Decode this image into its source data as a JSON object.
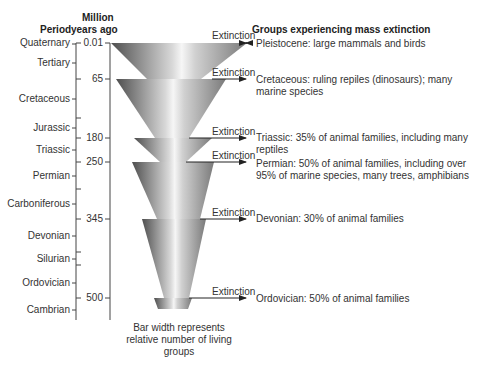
{
  "header": {
    "period_label": "Period",
    "years_label_line1": "Million",
    "years_label_line2": "years ago",
    "groups_label": "Groups experiencing mass extinction"
  },
  "periods": [
    {
      "name": "Quaternary",
      "y": 17
    },
    {
      "name": "Tertiary",
      "y": 35
    },
    {
      "name": "Cretaceous",
      "y": 70
    },
    {
      "name": "Jurassic",
      "y": 127
    },
    {
      "name": "Triassic",
      "y": 149
    },
    {
      "name": "Permian",
      "y": 175
    },
    {
      "name": "Carboniferous",
      "y": 203
    },
    {
      "name": "Devonian",
      "y": 235
    },
    {
      "name": "Silurian",
      "y": 258
    },
    {
      "name": "Ordovician",
      "y": 281
    },
    {
      "name": "Cambrian",
      "y": 309
    }
  ],
  "years": [
    {
      "value": "0.01",
      "y": 43
    },
    {
      "value": "65",
      "y": 79
    },
    {
      "value": "180",
      "y": 138
    },
    {
      "value": "250",
      "y": 162
    },
    {
      "value": "345",
      "y": 219
    },
    {
      "value": "500",
      "y": 298
    }
  ],
  "extinctions": [
    {
      "label": "Extinction",
      "y": 43,
      "description": "Pleistocene: large mammals and birds"
    },
    {
      "label": "Extinction",
      "y": 79,
      "description": "Cretaceous: ruling repiles (dinosaurs); many marine species"
    },
    {
      "label": "Extinction",
      "y": 138,
      "description": "Triassic: 35% of animal families, including many reptiles"
    },
    {
      "label": "Extinction",
      "y": 162,
      "description": "Permian: 50% of animal families, including over 95% of marine species, many trees, amphibians"
    },
    {
      "label": "Extinction",
      "y": 219,
      "description": "Devonian: 30% of animal families"
    },
    {
      "label": "Extinction",
      "y": 298,
      "description": "Ordovician: 50% of animal families"
    }
  ],
  "caption": "Bar width represents relative number of living groups",
  "colors": {
    "funnel_dark": "#5a5a5a",
    "funnel_light": "#f2f2f2",
    "line": "#333333"
  }
}
